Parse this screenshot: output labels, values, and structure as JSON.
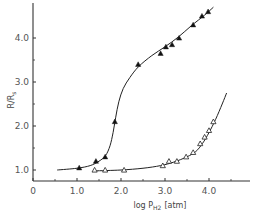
{
  "chart_data": {
    "type": "scatter",
    "title": "",
    "xlabel": "log P_H2 [atm]",
    "xlabel_main": "log P",
    "xlabel_sub": "H2",
    "xlabel_unit": "[atm]",
    "ylabel": "R/Rs",
    "ylabel_main": "R/R",
    "ylabel_sub": "s",
    "xlim": [
      0,
      4.6
    ],
    "ylim": [
      0.8,
      4.8
    ],
    "x_ticks": [
      {
        "value": 0,
        "label": "0"
      },
      {
        "value": 1.0,
        "label": "1.0"
      },
      {
        "value": 2.0,
        "label": "2.0"
      },
      {
        "value": 3.0,
        "label": "3.0"
      },
      {
        "value": 4.0,
        "label": "4.0"
      }
    ],
    "x_minor_ticks": [
      0.5,
      1.5,
      2.5,
      3.5,
      4.5
    ],
    "y_ticks": [
      {
        "value": 1.0,
        "label": "1.0"
      },
      {
        "value": 2.0,
        "label": "2.0"
      },
      {
        "value": 3.0,
        "label": "3.0"
      },
      {
        "value": 4.0,
        "label": "4.0"
      }
    ],
    "y_minor_ticks": [
      1.5,
      2.5,
      3.5
    ],
    "grid": false,
    "legend": null,
    "series": [
      {
        "name": "filled-triangles",
        "marker": "filled-triangle",
        "points": [
          [
            1.05,
            1.05
          ],
          [
            1.43,
            1.2
          ],
          [
            1.64,
            1.3
          ],
          [
            1.86,
            2.1
          ],
          [
            2.39,
            3.4
          ],
          [
            2.9,
            3.65
          ],
          [
            3.02,
            3.8
          ],
          [
            3.16,
            3.85
          ],
          [
            3.32,
            4.0
          ],
          [
            3.64,
            4.3
          ],
          [
            3.84,
            4.5
          ],
          [
            3.98,
            4.6
          ]
        ],
        "curve": [
          [
            0.55,
            1.0
          ],
          [
            1.0,
            1.04
          ],
          [
            1.3,
            1.1
          ],
          [
            1.5,
            1.2
          ],
          [
            1.65,
            1.33
          ],
          [
            1.75,
            1.55
          ],
          [
            1.82,
            1.85
          ],
          [
            1.88,
            2.2
          ],
          [
            1.95,
            2.55
          ],
          [
            2.05,
            2.85
          ],
          [
            2.2,
            3.1
          ],
          [
            2.4,
            3.35
          ],
          [
            2.7,
            3.6
          ],
          [
            3.0,
            3.8
          ],
          [
            3.3,
            4.02
          ],
          [
            3.6,
            4.28
          ],
          [
            3.9,
            4.52
          ],
          [
            4.1,
            4.7
          ]
        ]
      },
      {
        "name": "open-triangles",
        "marker": "open-triangle",
        "points": [
          [
            1.4,
            1.0
          ],
          [
            1.64,
            1.0
          ],
          [
            2.07,
            1.0
          ],
          [
            2.95,
            1.1
          ],
          [
            3.09,
            1.2
          ],
          [
            3.27,
            1.2
          ],
          [
            3.48,
            1.3
          ],
          [
            3.64,
            1.4
          ],
          [
            3.8,
            1.6
          ],
          [
            3.9,
            1.75
          ],
          [
            4.0,
            1.9
          ],
          [
            4.1,
            2.1
          ]
        ],
        "curve": [
          [
            1.4,
            0.98
          ],
          [
            2.0,
            1.0
          ],
          [
            2.5,
            1.04
          ],
          [
            2.9,
            1.1
          ],
          [
            3.2,
            1.18
          ],
          [
            3.5,
            1.3
          ],
          [
            3.7,
            1.42
          ],
          [
            3.85,
            1.6
          ],
          [
            4.0,
            1.85
          ],
          [
            4.15,
            2.15
          ],
          [
            4.3,
            2.5
          ],
          [
            4.4,
            2.75
          ]
        ]
      }
    ]
  }
}
